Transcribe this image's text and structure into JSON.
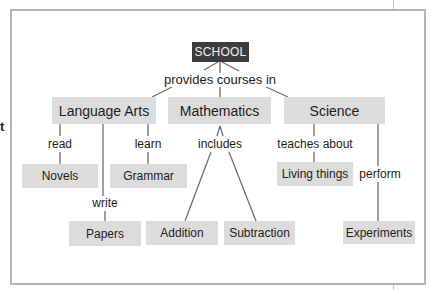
{
  "diagram": {
    "type": "concept-map",
    "edge_fragment_text": "t",
    "root": {
      "id": "school",
      "label": "SCHOOL"
    },
    "root_link_label": "provides courses in",
    "subjects": [
      {
        "id": "language-arts",
        "label": "Language Arts"
      },
      {
        "id": "mathematics",
        "label": "Mathematics"
      },
      {
        "id": "science",
        "label": "Science"
      }
    ],
    "link_labels": {
      "read": "read",
      "learn": "learn",
      "write": "write",
      "includes": "includes",
      "teaches_about": "teaches about",
      "perform": "perform"
    },
    "leaves": {
      "novels": "Novels",
      "grammar": "Grammar",
      "papers": "Papers",
      "addition": "Addition",
      "subtraction": "Subtraction",
      "living_things": "Living things",
      "experiments": "Experiments"
    },
    "relations": [
      {
        "from": "SCHOOL",
        "label": "provides courses in",
        "to": "Language Arts"
      },
      {
        "from": "SCHOOL",
        "label": "provides courses in",
        "to": "Mathematics"
      },
      {
        "from": "SCHOOL",
        "label": "provides courses in",
        "to": "Science"
      },
      {
        "from": "Language Arts",
        "label": "read",
        "to": "Novels"
      },
      {
        "from": "Language Arts",
        "label": "write",
        "to": "Papers"
      },
      {
        "from": "Language Arts",
        "label": "learn",
        "to": "Grammar"
      },
      {
        "from": "Mathematics",
        "label": "includes",
        "to": "Addition"
      },
      {
        "from": "Mathematics",
        "label": "includes",
        "to": "Subtraction"
      },
      {
        "from": "Science",
        "label": "teaches about",
        "to": "Living things"
      },
      {
        "from": "Science",
        "label": "perform",
        "to": "Experiments"
      }
    ],
    "colors": {
      "root_fill": "#3c3c3c",
      "root_text": "#f2f2f2",
      "node_fill": "#dcdcdc",
      "line": "#6e6e6e",
      "frame": "#b3b3b3"
    }
  }
}
